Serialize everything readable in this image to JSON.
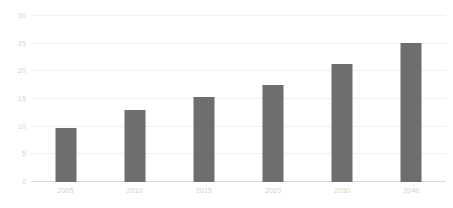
{
  "chart_data": {
    "type": "bar",
    "title": "",
    "subtitle": "",
    "xlabel": "",
    "ylabel": "",
    "categories": [
      "2005",
      "2010",
      "2015",
      "2020",
      "2030",
      "2040"
    ],
    "values": [
      9.8,
      13.1,
      15.3,
      17.5,
      21.3,
      25.2
    ],
    "series": [
      {
        "name": "",
        "values": [
          9.8,
          13.1,
          15.3,
          17.5,
          21.3,
          25.2
        ]
      }
    ],
    "ylim": [
      0,
      30
    ],
    "yticks": [
      0,
      5,
      10,
      15,
      20,
      25,
      30
    ],
    "ytick_labels": [
      "0",
      "5",
      "10",
      "15",
      "20",
      "25",
      "30"
    ],
    "grid": true,
    "grid_axis": "y",
    "legend": false,
    "legend_position": "none",
    "annotations": [],
    "colors": {
      "bar": "#6e6e6e",
      "gridline": "#f0f0f0",
      "baseline": "#dcdcdc",
      "tick_label": "#d4d4d4",
      "background": "#ffffff"
    }
  }
}
